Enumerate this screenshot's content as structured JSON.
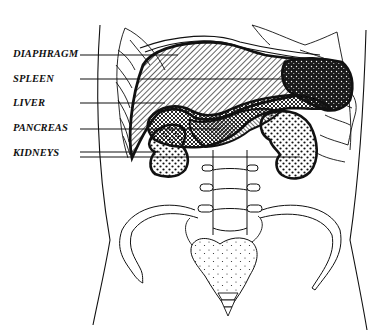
{
  "diagram": {
    "type": "anatomical-illustration",
    "labels": [
      {
        "id": "diaphragm",
        "text": "DIAPHRAGM",
        "y": 48
      },
      {
        "id": "spleen",
        "text": "SPLEEN",
        "y": 73
      },
      {
        "id": "liver",
        "text": "LIVER",
        "y": 97
      },
      {
        "id": "pancreas",
        "text": "PANCREAS",
        "y": 122
      },
      {
        "id": "kidneys",
        "text": "KIDNEYS",
        "y": 147
      }
    ],
    "colors": {
      "ink": "#111111",
      "background": "#ffffff"
    }
  }
}
